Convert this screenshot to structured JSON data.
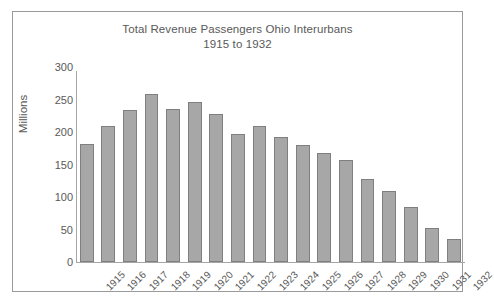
{
  "chart_data": {
    "type": "bar",
    "title": "Total Revenue Passengers Ohio Interurbans 1915 to 1932",
    "title_line1": "Total Revenue Passengers Ohio Interurbans",
    "title_line2": "1915 to 1932",
    "xlabel": "",
    "ylabel": "Millions",
    "ylim": [
      0,
      300
    ],
    "ytick_step": 50,
    "yticks": [
      "300",
      "250",
      "200",
      "150",
      "100",
      "50",
      "0"
    ],
    "grid": false,
    "legend": false,
    "bar_color": "#a7a7a7",
    "bar_border_color": "#7f7f7f",
    "text_color": "#595959",
    "frame_color": "#9a9a9a",
    "categories": [
      "1915",
      "1916",
      "1917",
      "1918",
      "1919",
      "1920",
      "1921",
      "1922",
      "1923",
      "1924",
      "1925",
      "1926",
      "1927",
      "1928",
      "1929",
      "1930",
      "1931",
      "1932"
    ],
    "values": [
      181,
      210,
      234,
      258,
      236,
      246,
      227,
      197,
      210,
      192,
      180,
      167,
      157,
      128,
      110,
      84,
      53,
      35
    ]
  }
}
